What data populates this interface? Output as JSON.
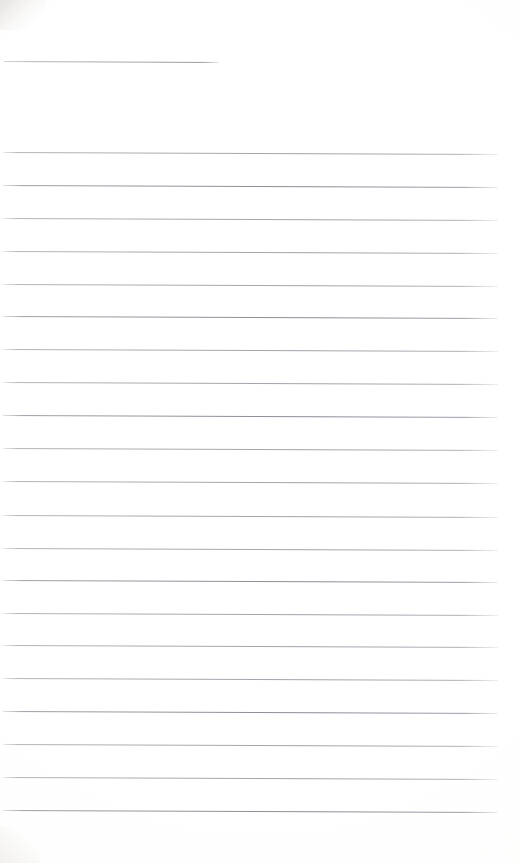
{
  "document": {
    "kind": "scanned-paper",
    "title": "Blank ruled notepad page",
    "page_number": "",
    "body_text": "",
    "header_line_text": "",
    "background_color": "#ffffff",
    "rule_color": "#b6babe",
    "width_px": 521,
    "height_px": 863
  },
  "layout": {
    "short_rule": {
      "name": "header-rule",
      "x": 4,
      "y": 61,
      "width": 215,
      "skew_deg": 0.25,
      "weight": "light"
    },
    "body_rules_meta": {
      "count": 21,
      "first_y": 152,
      "spacing": 32.9,
      "left_x": 3,
      "right_x": 498,
      "skew_deg": 0.22
    },
    "body_rules": [
      {
        "y": 152,
        "weight": "light"
      },
      {
        "y": 185,
        "weight": "dark"
      },
      {
        "y": 218,
        "weight": "light"
      },
      {
        "y": 251,
        "weight": "light"
      },
      {
        "y": 284,
        "weight": "light"
      },
      {
        "y": 316,
        "weight": "dark"
      },
      {
        "y": 349,
        "weight": "light"
      },
      {
        "y": 382,
        "weight": "light"
      },
      {
        "y": 415,
        "weight": "dark"
      },
      {
        "y": 448,
        "weight": "light"
      },
      {
        "y": 481,
        "weight": "light"
      },
      {
        "y": 515,
        "weight": "light"
      },
      {
        "y": 548,
        "weight": "light"
      },
      {
        "y": 580,
        "weight": "dark"
      },
      {
        "y": 613,
        "weight": "light"
      },
      {
        "y": 645,
        "weight": "light"
      },
      {
        "y": 678,
        "weight": "light"
      },
      {
        "y": 711,
        "weight": "dark"
      },
      {
        "y": 744,
        "weight": "light"
      },
      {
        "y": 777,
        "weight": "light"
      },
      {
        "y": 810,
        "weight": "dark"
      }
    ]
  }
}
